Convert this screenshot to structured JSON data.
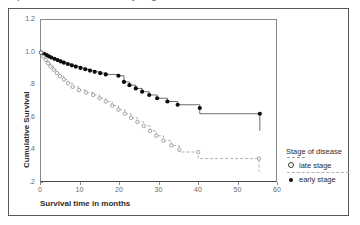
{
  "page": {
    "clipped_top_text": "Kaplan-Meier survival curves by stage of disease"
  },
  "axes": {
    "y_title": "Cumulative Survival",
    "x_title": "Survival time in months",
    "y_ticks": [
      "1.2",
      "1.0",
      ".8",
      ".6",
      ".4",
      ".2"
    ],
    "x_ticks": [
      "0",
      "10",
      "20",
      "30",
      "40",
      "50",
      "60"
    ]
  },
  "legend": {
    "title": "Stage of disease",
    "items": [
      {
        "label": "late stage",
        "marker": "open-circle-icon",
        "line": "dashed",
        "color": "#3a3a3a"
      },
      {
        "label": "early stage",
        "marker": "filled-circle-icon",
        "line": "solid",
        "color": "#0d0d0d"
      }
    ]
  },
  "chart_data": {
    "type": "line",
    "title": "Kaplan-Meier survival curves by stage of disease",
    "subtitle": "",
    "xlabel": "Survival time in months",
    "ylabel": "Cumulative Survival",
    "xlim": [
      0,
      60
    ],
    "ylim": [
      0.2,
      1.2
    ],
    "x_ticks": [
      0,
      10,
      20,
      30,
      40,
      50,
      60
    ],
    "y_ticks": [
      0.2,
      0.4,
      0.6,
      0.8,
      1.0,
      1.2
    ],
    "grid": false,
    "legend_position": "right",
    "legend_title": "Stage of disease",
    "plot_style": "stepped survival (Kaplan-Meier) with censoring markers",
    "series": [
      {
        "name": "early stage",
        "marker": "filled-circle",
        "linestyle": "solid",
        "color": "#0d0d0d",
        "points": [
          {
            "x": 0.0,
            "y": 1.0
          },
          {
            "x": 0.8,
            "y": 0.992
          },
          {
            "x": 1.4,
            "y": 0.985
          },
          {
            "x": 2.0,
            "y": 0.977
          },
          {
            "x": 2.6,
            "y": 0.97
          },
          {
            "x": 3.4,
            "y": 0.962
          },
          {
            "x": 4.2,
            "y": 0.954
          },
          {
            "x": 5.0,
            "y": 0.946
          },
          {
            "x": 5.8,
            "y": 0.938
          },
          {
            "x": 6.8,
            "y": 0.93
          },
          {
            "x": 7.8,
            "y": 0.922
          },
          {
            "x": 8.8,
            "y": 0.914
          },
          {
            "x": 10.0,
            "y": 0.906
          },
          {
            "x": 11.2,
            "y": 0.898
          },
          {
            "x": 12.4,
            "y": 0.89
          },
          {
            "x": 13.6,
            "y": 0.882
          },
          {
            "x": 15.0,
            "y": 0.874
          },
          {
            "x": 16.4,
            "y": 0.866
          },
          {
            "x": 19.6,
            "y": 0.858
          },
          {
            "x": 21.0,
            "y": 0.82
          },
          {
            "x": 22.4,
            "y": 0.8
          },
          {
            "x": 24.0,
            "y": 0.78
          },
          {
            "x": 25.6,
            "y": 0.76
          },
          {
            "x": 27.4,
            "y": 0.74
          },
          {
            "x": 29.4,
            "y": 0.72
          },
          {
            "x": 32.0,
            "y": 0.7
          },
          {
            "x": 34.6,
            "y": 0.68
          },
          {
            "x": 40.2,
            "y": 0.66
          },
          {
            "x": 40.2,
            "y": 0.625
          },
          {
            "x": 55.4,
            "y": 0.625
          },
          {
            "x": 55.4,
            "y": 0.52
          }
        ],
        "censored_x": [
          40.2,
          55.4
        ]
      },
      {
        "name": "late stage",
        "marker": "open-circle",
        "linestyle": "dashed",
        "color": "#8a8a8a",
        "points": [
          {
            "x": 0.0,
            "y": 1.0
          },
          {
            "x": 0.6,
            "y": 0.975
          },
          {
            "x": 1.2,
            "y": 0.955
          },
          {
            "x": 1.8,
            "y": 0.935
          },
          {
            "x": 2.4,
            "y": 0.915
          },
          {
            "x": 3.2,
            "y": 0.895
          },
          {
            "x": 4.0,
            "y": 0.875
          },
          {
            "x": 4.8,
            "y": 0.855
          },
          {
            "x": 5.8,
            "y": 0.835
          },
          {
            "x": 6.8,
            "y": 0.812
          },
          {
            "x": 8.0,
            "y": 0.79
          },
          {
            "x": 9.6,
            "y": 0.77
          },
          {
            "x": 11.4,
            "y": 0.755
          },
          {
            "x": 13.2,
            "y": 0.74
          },
          {
            "x": 14.8,
            "y": 0.72
          },
          {
            "x": 16.4,
            "y": 0.7
          },
          {
            "x": 18.0,
            "y": 0.675
          },
          {
            "x": 19.6,
            "y": 0.65
          },
          {
            "x": 21.2,
            "y": 0.625
          },
          {
            "x": 22.8,
            "y": 0.6
          },
          {
            "x": 24.4,
            "y": 0.575
          },
          {
            "x": 26.0,
            "y": 0.55
          },
          {
            "x": 27.6,
            "y": 0.52
          },
          {
            "x": 29.2,
            "y": 0.49
          },
          {
            "x": 31.0,
            "y": 0.46
          },
          {
            "x": 33.0,
            "y": 0.43
          },
          {
            "x": 35.0,
            "y": 0.405
          },
          {
            "x": 35.0,
            "y": 0.39
          },
          {
            "x": 39.8,
            "y": 0.39
          },
          {
            "x": 39.8,
            "y": 0.35
          },
          {
            "x": 55.2,
            "y": 0.35
          },
          {
            "x": 55.2,
            "y": 0.27
          }
        ],
        "censored_x": [
          35.0,
          39.8,
          55.2
        ]
      }
    ]
  }
}
